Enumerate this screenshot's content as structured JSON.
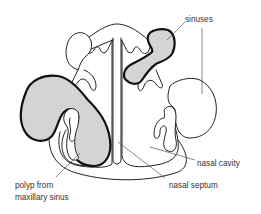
{
  "diagram": {
    "labels": {
      "sinuses": "sinuses",
      "nasal_cavity": "nasal cavity",
      "nasal_septum": "nasal septum",
      "polyp_line1": "polyp from",
      "polyp_line2": "maxillary sinus"
    },
    "colors": {
      "outline": "#222222",
      "polyp_outline": "#111111",
      "polyp_fill": "#d4d4d4",
      "leader": "#555555",
      "text": "#333333",
      "background": "#ffffff"
    }
  }
}
